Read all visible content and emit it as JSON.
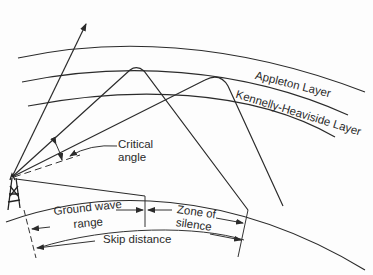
{
  "diagram": {
    "layers": [
      {
        "name": "Appleton Layer"
      },
      {
        "name": "Kennelly-Heaviside Layer"
      }
    ],
    "labels": {
      "appleton": "Appleton Layer",
      "kennelly": "Kennelly-Heaviside Layer",
      "critical_line1": "Critical",
      "critical_line2": "angle",
      "ground_line1": "Ground wave",
      "ground_line2": "range",
      "zone_line1": "Zone of",
      "zone_line2": "silence",
      "skip": "Skip distance"
    },
    "elements": [
      "transmitter-tower",
      "escaping-ray",
      "reflected-ray-appleton",
      "reflected-ray-kennelly",
      "ground-wave",
      "earth-surface"
    ],
    "colors": {
      "ink": "#2b2b2b",
      "background": "#fdfdfd"
    }
  }
}
